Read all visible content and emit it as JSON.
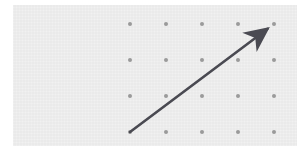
{
  "figure": {
    "title": "",
    "background_color": "#ffffff",
    "panel": {
      "fill_color": "#ebebeb",
      "x": 13,
      "y": 5,
      "width": 284,
      "height": 141
    }
  },
  "chart_data": {
    "type": "scatter",
    "title": "",
    "subtitle": "",
    "xlabel": "",
    "ylabel": "",
    "grid": true,
    "legend": null,
    "legend_position": "none",
    "tick_labels_x": [],
    "tick_labels_y": [],
    "annotations": [],
    "dot_grid": {
      "rows": 4,
      "columns": 5,
      "dot_color": "#9a9a9a",
      "dot_radius_px": 2,
      "spacing_x_px": 36,
      "spacing_y_px": 36,
      "origin_x_px": 117,
      "origin_y_px": 19,
      "points": [
        {
          "col": 0,
          "row": 0,
          "x": 117,
          "y": 19
        },
        {
          "col": 1,
          "row": 0,
          "x": 153,
          "y": 19
        },
        {
          "col": 2,
          "row": 0,
          "x": 189,
          "y": 19
        },
        {
          "col": 3,
          "row": 0,
          "x": 225,
          "y": 19
        },
        {
          "col": 4,
          "row": 0,
          "x": 261,
          "y": 19
        },
        {
          "col": 0,
          "row": 1,
          "x": 117,
          "y": 55
        },
        {
          "col": 1,
          "row": 1,
          "x": 153,
          "y": 55
        },
        {
          "col": 2,
          "row": 1,
          "x": 189,
          "y": 55
        },
        {
          "col": 3,
          "row": 1,
          "x": 225,
          "y": 55
        },
        {
          "col": 4,
          "row": 1,
          "x": 261,
          "y": 55
        },
        {
          "col": 0,
          "row": 2,
          "x": 117,
          "y": 91
        },
        {
          "col": 1,
          "row": 2,
          "x": 153,
          "y": 91
        },
        {
          "col": 2,
          "row": 2,
          "x": 189,
          "y": 91
        },
        {
          "col": 3,
          "row": 2,
          "x": 225,
          "y": 91
        },
        {
          "col": 4,
          "row": 2,
          "x": 261,
          "y": 91
        },
        {
          "col": 0,
          "row": 3,
          "x": 117,
          "y": 127
        },
        {
          "col": 1,
          "row": 3,
          "x": 153,
          "y": 127
        },
        {
          "col": 2,
          "row": 3,
          "x": 189,
          "y": 127
        },
        {
          "col": 3,
          "row": 3,
          "x": 225,
          "y": 127
        },
        {
          "col": 4,
          "row": 3,
          "x": 261,
          "y": 127
        }
      ]
    },
    "vectors": [
      {
        "name": "diagonal-arrow",
        "color": "#4a4a52",
        "stroke_width_px": 2.6,
        "start": {
          "x": 117,
          "y": 127,
          "col": 0,
          "row": 3
        },
        "end": {
          "x": 261,
          "y": 19,
          "col": 4,
          "row": 0
        },
        "components": {
          "dx_cells": 4,
          "dy_cells": 3
        },
        "components_px": {
          "dx": 144,
          "dy": -108
        },
        "length_px": 180,
        "arrowhead": "barbed",
        "arrowhead_at": "end"
      }
    ]
  }
}
